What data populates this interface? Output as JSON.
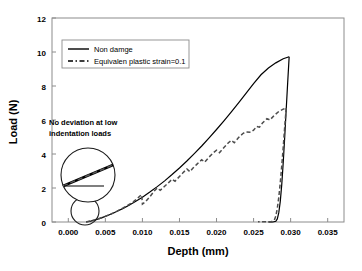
{
  "chart_data": {
    "type": "line",
    "title": "",
    "xlabel": "Depth (mm)",
    "ylabel": "Load (N)",
    "xlim": [
      -0.0022,
      0.0372
    ],
    "ylim": [
      0,
      12
    ],
    "xticks": [
      "0.000",
      "0.005",
      "0.010",
      "0.015",
      "0.020",
      "0.025",
      "0.030",
      "0.035"
    ],
    "xtick_values": [
      0.0,
      0.005,
      0.01,
      0.015,
      0.02,
      0.025,
      0.03,
      0.035
    ],
    "yticks": [
      "0",
      "2",
      "4",
      "6",
      "8",
      "10",
      "12"
    ],
    "ytick_values": [
      0,
      2,
      4,
      6,
      8,
      10,
      12
    ],
    "grid": false,
    "legend_position": "upper-left-inside",
    "series": [
      {
        "name": "Non damge",
        "style": "solid",
        "color": "#000000",
        "loading": [
          [
            0.0024,
            0.0
          ],
          [
            0.003,
            0.05
          ],
          [
            0.0036,
            0.12
          ],
          [
            0.0042,
            0.2
          ],
          [
            0.005,
            0.33
          ],
          [
            0.0058,
            0.47
          ],
          [
            0.0066,
            0.63
          ],
          [
            0.0074,
            0.8
          ],
          [
            0.0082,
            0.99
          ],
          [
            0.009,
            1.19
          ],
          [
            0.01,
            1.46
          ],
          [
            0.011,
            1.76
          ],
          [
            0.012,
            2.08
          ],
          [
            0.013,
            2.42
          ],
          [
            0.014,
            2.79
          ],
          [
            0.015,
            3.18
          ],
          [
            0.016,
            3.59
          ],
          [
            0.017,
            4.02
          ],
          [
            0.018,
            4.47
          ],
          [
            0.019,
            4.95
          ],
          [
            0.02,
            5.44
          ],
          [
            0.021,
            5.95
          ],
          [
            0.022,
            6.48
          ],
          [
            0.023,
            7.02
          ],
          [
            0.024,
            7.58
          ],
          [
            0.025,
            8.14
          ],
          [
            0.026,
            8.66
          ],
          [
            0.027,
            9.06
          ],
          [
            0.028,
            9.36
          ],
          [
            0.029,
            9.6
          ],
          [
            0.0298,
            9.72
          ]
        ],
        "unloading": [
          [
            0.0298,
            9.72
          ],
          [
            0.0296,
            8.2
          ],
          [
            0.0294,
            6.6
          ],
          [
            0.0292,
            5.0
          ],
          [
            0.029,
            3.5
          ],
          [
            0.0288,
            2.2
          ],
          [
            0.0286,
            1.2
          ],
          [
            0.0284,
            0.55
          ],
          [
            0.0282,
            0.18
          ],
          [
            0.028,
            0.04
          ],
          [
            0.0276,
            0.0
          ],
          [
            0.027,
            0.0
          ]
        ],
        "peak": [
          0.0298,
          9.72
        ]
      },
      {
        "name": "Equivalen plastic strain=0.1",
        "style": "dashed",
        "color": "#4d4d4d",
        "loading": [
          [
            0.0024,
            0.0
          ],
          [
            0.0032,
            0.08
          ],
          [
            0.004,
            0.18
          ],
          [
            0.0048,
            0.3
          ],
          [
            0.0056,
            0.44
          ],
          [
            0.0064,
            0.6
          ],
          [
            0.0072,
            0.78
          ],
          [
            0.008,
            0.98
          ],
          [
            0.0088,
            1.2
          ],
          [
            0.0094,
            1.42
          ],
          [
            0.0098,
            1.58
          ],
          [
            0.0099,
            1.6
          ],
          [
            0.01,
            1.05
          ],
          [
            0.0104,
            1.18
          ],
          [
            0.011,
            1.48
          ],
          [
            0.0116,
            1.82
          ],
          [
            0.012,
            2.0
          ],
          [
            0.0124,
            1.86
          ],
          [
            0.0128,
            2.02
          ],
          [
            0.0134,
            2.26
          ],
          [
            0.014,
            2.52
          ],
          [
            0.0144,
            2.4
          ],
          [
            0.015,
            2.68
          ],
          [
            0.0156,
            2.95
          ],
          [
            0.016,
            3.12
          ],
          [
            0.0164,
            2.96
          ],
          [
            0.0168,
            3.16
          ],
          [
            0.0174,
            3.42
          ],
          [
            0.018,
            3.66
          ],
          [
            0.0184,
            3.52
          ],
          [
            0.019,
            3.82
          ],
          [
            0.0196,
            4.08
          ],
          [
            0.02,
            4.22
          ],
          [
            0.0204,
            4.08
          ],
          [
            0.021,
            4.38
          ],
          [
            0.0216,
            4.66
          ],
          [
            0.022,
            4.8
          ],
          [
            0.0224,
            4.66
          ],
          [
            0.023,
            4.98
          ],
          [
            0.0236,
            5.22
          ],
          [
            0.024,
            5.3
          ],
          [
            0.0246,
            5.28
          ],
          [
            0.025,
            5.4
          ],
          [
            0.0254,
            5.62
          ],
          [
            0.0258,
            5.58
          ],
          [
            0.0262,
            5.82
          ],
          [
            0.0268,
            6.08
          ],
          [
            0.0272,
            6.0
          ],
          [
            0.0278,
            6.28
          ],
          [
            0.0284,
            6.5
          ],
          [
            0.029,
            6.64
          ],
          [
            0.0294,
            6.7
          ]
        ],
        "unloading": [
          [
            0.0294,
            6.7
          ],
          [
            0.0292,
            5.6
          ],
          [
            0.029,
            4.4
          ],
          [
            0.0288,
            3.3
          ],
          [
            0.0286,
            2.3
          ],
          [
            0.0284,
            1.45
          ],
          [
            0.0282,
            0.8
          ],
          [
            0.028,
            0.35
          ],
          [
            0.0278,
            0.1
          ],
          [
            0.0274,
            0.02
          ],
          [
            0.0264,
            0.02
          ],
          [
            0.0256,
            0.02
          ]
        ],
        "peak": [
          0.0294,
          6.7
        ]
      }
    ],
    "annotations": [
      {
        "text_line1": "No deviation at low",
        "text_line2": "indentation loads",
        "callout": "magnified-inset",
        "inset_shows": "solid and dashed curves overlapping with horizontal reference line"
      }
    ]
  },
  "legend": {
    "entries": [
      {
        "label": "Non damge",
        "style": "solid"
      },
      {
        "label": "Equivalen plastic strain=0.1",
        "style": "dash-dot"
      }
    ]
  },
  "axes": {
    "x_title": "Depth (mm)",
    "y_title": "Load (N)"
  },
  "annotation": {
    "line1": "No deviation at low",
    "line2": "indentation loads"
  },
  "colors": {
    "background": "#ffffff",
    "frame": "#8c8c8c",
    "solid_series": "#000000",
    "dashed_series": "#4d4d4d",
    "text": "#000000"
  }
}
